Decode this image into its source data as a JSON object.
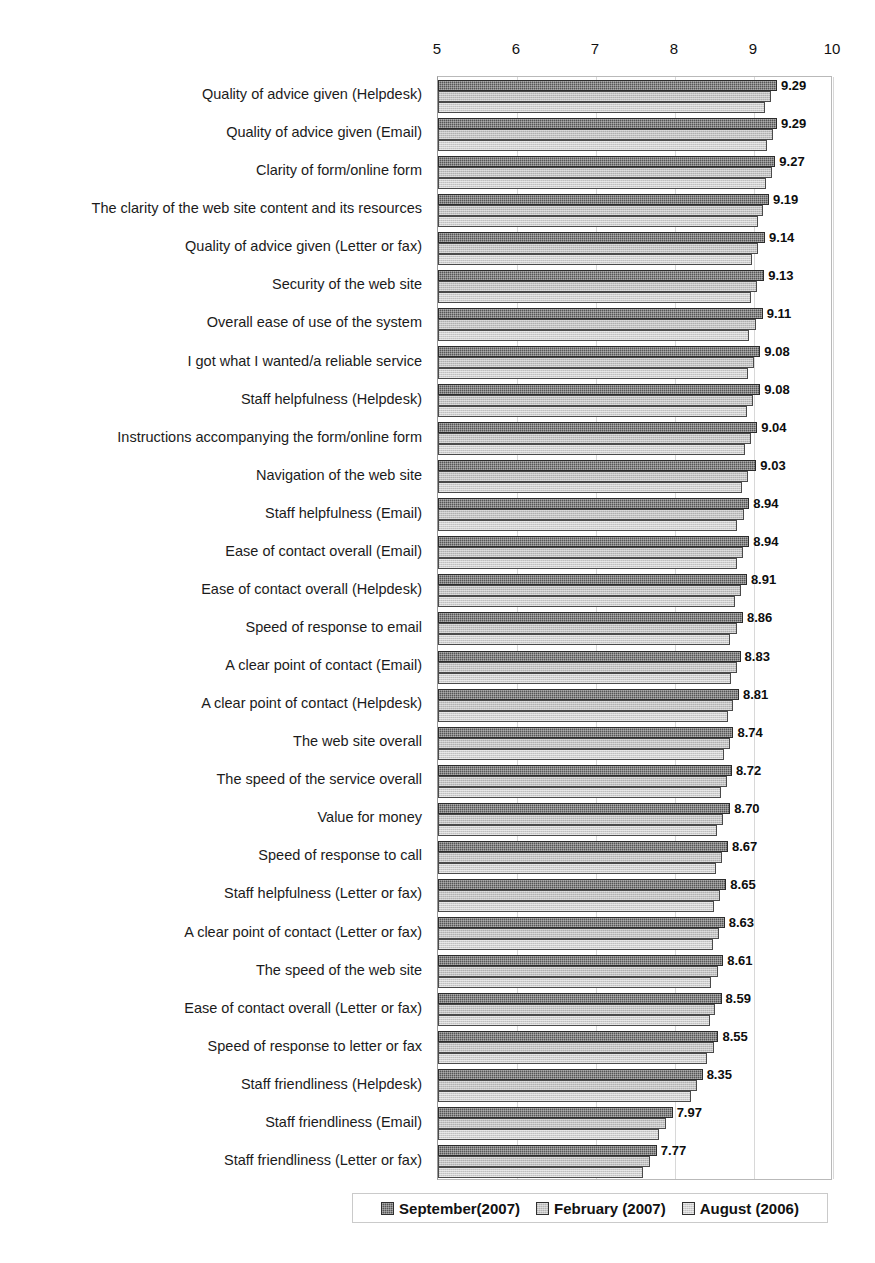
{
  "chart_data": {
    "type": "bar",
    "orientation": "horizontal",
    "title": "",
    "subtitle": "",
    "xlabel": "",
    "ylabel": "",
    "xlim": [
      5,
      10
    ],
    "xticks": [
      "5",
      "6",
      "7",
      "8",
      "9",
      "10"
    ],
    "grid": true,
    "legend_position": "bottom",
    "value_label_series": "September(2007)",
    "categories": [
      "Quality of advice given (Helpdesk)",
      "Quality of advice given (Email)",
      "Clarity of form/online form",
      "The clarity of the web site content and its resources",
      "Quality of advice given (Letter or fax)",
      "Security of the web site",
      "Overall ease of use of the system",
      "I got what I wanted/a reliable service",
      "Staff helpfulness (Helpdesk)",
      "Instructions accompanying the form/online form",
      "Navigation of the web site",
      "Staff helpfulness (Email)",
      "Ease of contact overall (Email)",
      "Ease of contact overall (Helpdesk)",
      "Speed of response to email",
      "A clear point of contact (Email)",
      "A clear point of contact (Helpdesk)",
      "The web site overall",
      "The speed of the service overall",
      "Value for money",
      "Speed of response to call",
      "Staff helpfulness (Letter or fax)",
      "A clear point of contact (Letter or fax)",
      "The speed of the web site",
      "Ease of contact overall (Letter or fax)",
      "Speed of response to letter or fax",
      "Staff friendliness (Helpdesk)",
      "Staff friendliness (Email)",
      "Staff friendliness (Letter or fax)"
    ],
    "series": [
      {
        "name": "September(2007)",
        "color": "#555555",
        "values": [
          9.29,
          9.29,
          9.27,
          9.19,
          9.14,
          9.13,
          9.11,
          9.08,
          9.08,
          9.04,
          9.03,
          8.94,
          8.94,
          8.91,
          8.86,
          8.83,
          8.81,
          8.74,
          8.72,
          8.7,
          8.67,
          8.65,
          8.63,
          8.61,
          8.59,
          8.55,
          8.35,
          7.97,
          7.77
        ],
        "labels": [
          "9.29",
          "9.29",
          "9.27",
          "9.19",
          "9.14",
          "9.13",
          "9.11",
          "9.08",
          "9.08",
          "9.04",
          "9.03",
          "8.94",
          "8.94",
          "8.91",
          "8.86",
          "8.83",
          "8.81",
          "8.74",
          "8.72",
          "8.70",
          "8.67",
          "8.65",
          "8.63",
          "8.61",
          "8.59",
          "8.55",
          "8.35",
          "7.97",
          "7.77"
        ]
      },
      {
        "name": "February (2007)",
        "color": "#c2c2c2",
        "values": [
          9.22,
          9.24,
          9.23,
          9.12,
          9.05,
          9.04,
          9.02,
          9.0,
          8.99,
          8.96,
          8.92,
          8.87,
          8.86,
          8.84,
          8.78,
          8.79,
          8.74,
          8.69,
          8.66,
          8.61,
          8.6,
          8.57,
          8.56,
          8.54,
          8.51,
          8.49,
          8.28,
          7.88,
          7.68
        ]
      },
      {
        "name": "August (2006)",
        "color": "#cfcfcf",
        "values": [
          9.14,
          9.16,
          9.15,
          9.05,
          8.97,
          8.96,
          8.94,
          8.92,
          8.91,
          8.88,
          8.85,
          8.79,
          8.78,
          8.76,
          8.7,
          8.71,
          8.67,
          8.62,
          8.58,
          8.53,
          8.52,
          8.49,
          8.48,
          8.46,
          8.44,
          8.41,
          8.2,
          7.8,
          7.6
        ]
      }
    ]
  },
  "legend": {
    "entries": [
      {
        "label": "September(2007)",
        "swatch": "s0"
      },
      {
        "label": "February (2007)",
        "swatch": "s1"
      },
      {
        "label": "August (2006)",
        "swatch": "s2"
      }
    ]
  }
}
